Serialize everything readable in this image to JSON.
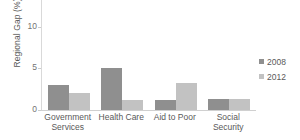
{
  "chart_data": {
    "type": "bar",
    "title": "",
    "subtitle": "",
    "xlabel": "",
    "ylabel": "Regional Gap (%)",
    "categories": [
      "Government Services",
      "Health Care",
      "Aid to Poor",
      "Social Security"
    ],
    "series": [
      {
        "name": "2008",
        "color": "#8f8f8f",
        "values": [
          3.0,
          5.1,
          1.2,
          1.3
        ]
      },
      {
        "name": "2012",
        "color": "#c2c2c2",
        "values": [
          2.1,
          1.2,
          3.2,
          1.3
        ]
      }
    ],
    "ylim": [
      0,
      13.2
    ],
    "yticks": [
      0,
      5,
      10
    ],
    "ytick_labels": [
      "0",
      "5",
      "10"
    ],
    "grid": false,
    "legend_position": "right",
    "legend_entries": [
      "2008",
      "2012"
    ]
  },
  "axes": {
    "y_title": "Regional Gap (%)"
  },
  "legend": {
    "items": [
      {
        "label": "2008"
      },
      {
        "label": "2012"
      }
    ]
  }
}
